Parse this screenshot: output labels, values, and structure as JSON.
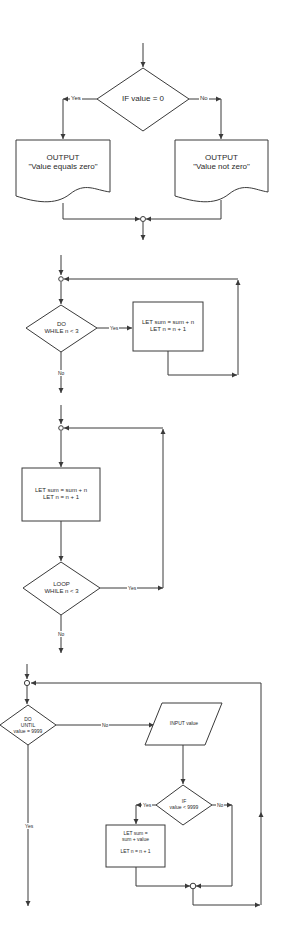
{
  "colors": {
    "line": "#3a3a3a",
    "text": "#2a2a2a",
    "background": "#ffffff"
  },
  "diagrams": [
    {
      "id": "if-then-else",
      "decision": "IF value = 0",
      "yes_label": "Yes",
      "no_label": "No",
      "yes_output": {
        "line1": "OUTPUT",
        "line2": "\"Value equals zero\""
      },
      "no_output": {
        "line1": "OUTPUT",
        "line2": "\"Value not zero\""
      }
    },
    {
      "id": "do-while",
      "decision": {
        "line1": "DO",
        "line2": "WHILE n < 3"
      },
      "yes_label": "Yes",
      "no_label": "No",
      "process": {
        "line1": "LET sum = sum + n",
        "line2": "LET n = n + 1"
      }
    },
    {
      "id": "loop-while",
      "process": {
        "line1": "LET sum = sum + n",
        "line2": "LET n = n + 1"
      },
      "decision": {
        "line1": "LOOP",
        "line2": "WHILE n < 3"
      },
      "yes_label": "Yes",
      "no_label": "No"
    },
    {
      "id": "do-until",
      "decision": {
        "line1": "DO",
        "line2": "UNTIL",
        "line3": "value = 9999"
      },
      "no_label": "No",
      "yes_label": "Yes",
      "input": "INPUT value",
      "inner_decision": {
        "line1": "IF",
        "line2": "value < 9999"
      },
      "inner_yes_label": "Yes",
      "inner_no_label": "No",
      "process": {
        "line1": "LET sum =",
        "line2": "sum + value",
        "line3": "LET n = n + 1"
      }
    }
  ]
}
